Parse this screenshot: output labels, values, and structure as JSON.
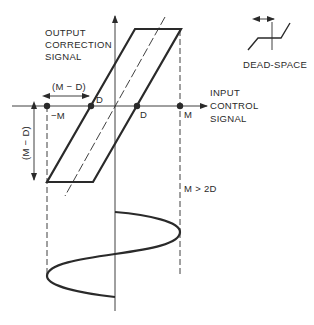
{
  "diagram": {
    "type": "hysteresis dead-space characteristic with sinusoidal input",
    "y_axis_label": [
      "OUTPUT",
      "CORRECTION",
      "SIGNAL"
    ],
    "x_axis_label": [
      "INPUT",
      "CONTROL",
      "SIGNAL"
    ],
    "points": {
      "neg_m": "−M",
      "d_left": "D",
      "d_right": "D",
      "m": "M"
    },
    "horizontal_dimension": "(M − D)",
    "vertical_dimension": "(M − D)",
    "condition": "M > 2D",
    "inset": {
      "label": "DEAD-SPACE"
    }
  },
  "colors": {
    "ink": "#2a2a2a",
    "background": "#ffffff"
  }
}
